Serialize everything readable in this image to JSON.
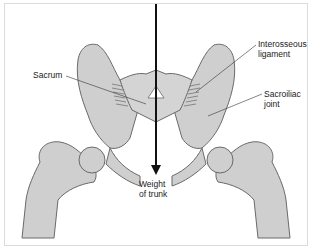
{
  "diagram": {
    "type": "anatomical-illustration",
    "colors": {
      "bone_fill": "#cfcfcf",
      "bone_outline": "#6a6a6a",
      "arrow": "#111111",
      "leader_line": "#333333",
      "background": "#ffffff"
    },
    "labels": {
      "sacrum": "Sacrum",
      "interosseous_line1": "Interosseous",
      "interosseous_line2": "ligament",
      "sacroiliac_line1": "Sacroiliac",
      "sacroiliac_line2": "joint",
      "weight_line1": "Weight",
      "weight_line2": "of trunk"
    },
    "arrow": {
      "meaning": "Weight of trunk transmitted downward",
      "direction": "down"
    }
  }
}
